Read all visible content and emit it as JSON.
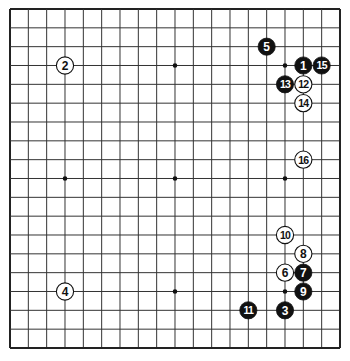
{
  "board": {
    "size": 19,
    "origin_x": 10,
    "origin_y": 9,
    "spacing_x": 18.333,
    "spacing_y": 18.833,
    "line_color": "#333333",
    "border_color": "#222222",
    "background": "#ffffff",
    "star_points": [
      [
        3,
        3
      ],
      [
        9,
        3
      ],
      [
        15,
        3
      ],
      [
        3,
        9
      ],
      [
        9,
        9
      ],
      [
        15,
        9
      ],
      [
        3,
        15
      ],
      [
        9,
        15
      ],
      [
        15,
        15
      ]
    ]
  },
  "stones": [
    {
      "move": "1",
      "color": "black",
      "col": 16,
      "row": 3
    },
    {
      "move": "2",
      "color": "white",
      "col": 3,
      "row": 3
    },
    {
      "move": "3",
      "color": "black",
      "col": 15,
      "row": 16
    },
    {
      "move": "4",
      "color": "white",
      "col": 3,
      "row": 15
    },
    {
      "move": "5",
      "color": "black",
      "col": 14,
      "row": 2
    },
    {
      "move": "6",
      "color": "white",
      "col": 15,
      "row": 14
    },
    {
      "move": "7",
      "color": "black",
      "col": 16,
      "row": 14
    },
    {
      "move": "8",
      "color": "white",
      "col": 16,
      "row": 13
    },
    {
      "move": "9",
      "color": "black",
      "col": 16,
      "row": 15
    },
    {
      "move": "10",
      "color": "white",
      "col": 15,
      "row": 12
    },
    {
      "move": "11",
      "color": "black",
      "col": 13,
      "row": 16
    },
    {
      "move": "12",
      "color": "white",
      "col": 16,
      "row": 4
    },
    {
      "move": "13",
      "color": "black",
      "col": 15,
      "row": 4
    },
    {
      "move": "14",
      "color": "white",
      "col": 16,
      "row": 5
    },
    {
      "move": "15",
      "color": "black",
      "col": 17,
      "row": 3
    },
    {
      "move": "16",
      "color": "white",
      "col": 16,
      "row": 8
    }
  ]
}
